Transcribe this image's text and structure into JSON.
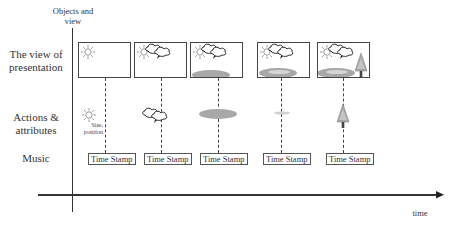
{
  "axes": {
    "vertical_label": "Objects and view",
    "vertical_label_line1": "Objects and",
    "vertical_label_line2": "view",
    "horizontal_label": "time"
  },
  "rows": [
    {
      "id": "presentation",
      "label_line1": "The view of",
      "label_line2": "presentation"
    },
    {
      "id": "actions",
      "label_line1": "Actions &",
      "label_line2": "attributes"
    },
    {
      "id": "music",
      "label_line1": "Music",
      "label_line2": ""
    }
  ],
  "annotation": {
    "line1": "Size,",
    "line2": "position"
  },
  "frames": [
    {
      "index": 1,
      "contents": [
        "sun"
      ],
      "action": "sun",
      "time_stamp": "Time Stamp"
    },
    {
      "index": 2,
      "contents": [
        "sun",
        "clouds"
      ],
      "action": "clouds",
      "time_stamp": "Time Stamp"
    },
    {
      "index": 3,
      "contents": [
        "sun",
        "clouds",
        "ground"
      ],
      "action": "ground",
      "time_stamp": "Time Stamp"
    },
    {
      "index": 4,
      "contents": [
        "sun",
        "clouds",
        "ground",
        "lake"
      ],
      "action": "lake-highlight",
      "time_stamp": "Time Stamp"
    },
    {
      "index": 5,
      "contents": [
        "sun",
        "clouds",
        "ground",
        "lake",
        "tree"
      ],
      "action": "tree",
      "time_stamp": "Time Stamp"
    }
  ],
  "colors": {
    "line": "#333333",
    "sun": "#9a9a9a",
    "ground": "#a8a8a8",
    "lake": "#d6d6d6",
    "tree": "#a0a0a0",
    "trunk": "#444444"
  }
}
